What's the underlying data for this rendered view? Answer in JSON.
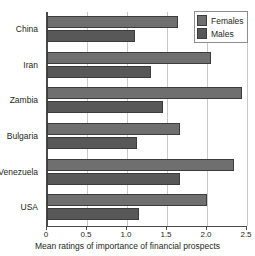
{
  "chart_data": {
    "type": "bar",
    "orientation": "horizontal",
    "title": "",
    "xlabel": "Mean ratings of importance of financial prospects",
    "ylabel": "",
    "xlim": [
      0,
      2.5
    ],
    "xticks": [
      "0",
      "0.5",
      "1.0",
      "1.5",
      "2.0",
      "2.5"
    ],
    "xtick_values": [
      0,
      0.5,
      1.0,
      1.5,
      2.0,
      2.5
    ],
    "grid": true,
    "legend_position": "top-right",
    "categories": [
      "China",
      "Iran",
      "Zambia",
      "Bulgaria",
      "Venezuela",
      "USA"
    ],
    "series": [
      {
        "name": "Females",
        "color": "#6f6f6f",
        "values": [
          1.64,
          2.05,
          2.44,
          1.66,
          2.34,
          2.0
        ]
      },
      {
        "name": "Males",
        "color": "#585858",
        "values": [
          1.1,
          1.3,
          1.45,
          1.12,
          1.66,
          1.15
        ]
      }
    ]
  },
  "legend": {
    "items": [
      {
        "label": "Females",
        "swatch": "females-swatch"
      },
      {
        "label": "Males",
        "swatch": "males-swatch"
      }
    ]
  },
  "colors": {
    "females": "#6f6f6f",
    "males": "#585858",
    "axis": "#4a4a4a",
    "grid": "#c9c9c9",
    "text": "#231f20"
  }
}
